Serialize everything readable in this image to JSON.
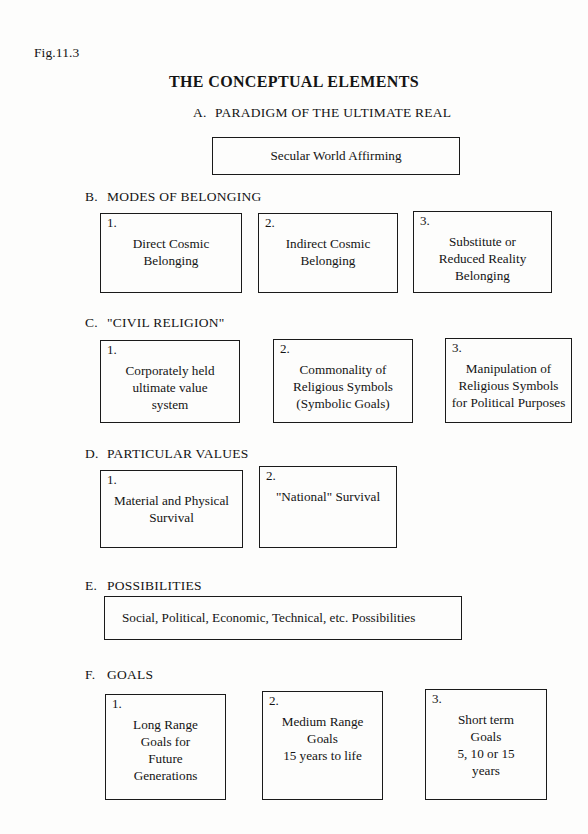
{
  "figure_label": "Fig.11.3",
  "title": "THE CONCEPTUAL ELEMENTS",
  "sections": [
    {
      "letter": "A.",
      "heading": "PARADIGM OF THE ULTIMATE REAL",
      "boxes": [
        {
          "number": "",
          "text": "Secular World Affirming"
        }
      ]
    },
    {
      "letter": "B.",
      "heading": "MODES OF BELONGING",
      "boxes": [
        {
          "number": "1.",
          "text": "Direct Cosmic\nBelonging"
        },
        {
          "number": "2.",
          "text": "Indirect Cosmic\nBelonging"
        },
        {
          "number": "3.",
          "text": "Substitute or\nReduced Reality\nBelonging"
        }
      ]
    },
    {
      "letter": "C.",
      "heading": "\"CIVIL RELIGION\"",
      "boxes": [
        {
          "number": "1.",
          "text": "Corporately held\nultimate value\nsystem"
        },
        {
          "number": "2.",
          "text": "Commonality of\nReligious Symbols\n(Symbolic Goals)"
        },
        {
          "number": "3.",
          "text": "Manipulation of\nReligious Symbols\nfor Political Purposes"
        }
      ]
    },
    {
      "letter": "D.",
      "heading": "PARTICULAR VALUES",
      "boxes": [
        {
          "number": "1.",
          "text": "Material and Physical\nSurvival"
        },
        {
          "number": "2.",
          "text": "\"National\" Survival"
        }
      ]
    },
    {
      "letter": "E.",
      "heading": "POSSIBILITIES",
      "boxes": [
        {
          "number": "",
          "text": "Social, Political, Economic, Technical, etc. Possibilities"
        }
      ]
    },
    {
      "letter": "F.",
      "heading": "GOALS",
      "boxes": [
        {
          "number": "1.",
          "text": "Long Range\nGoals for\nFuture\nGenerations"
        },
        {
          "number": "2.",
          "text": "Medium Range\nGoals\n15 years to life"
        },
        {
          "number": "3.",
          "text": "Short term\nGoals\n5, 10 or 15\nyears"
        }
      ]
    }
  ]
}
